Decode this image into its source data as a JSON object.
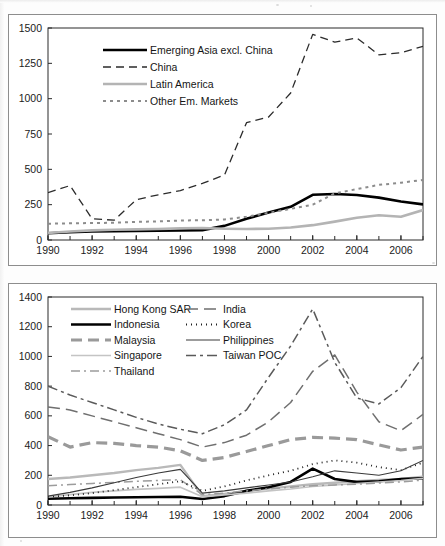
{
  "page": {
    "background_color": "#fdfdfd",
    "frame_color": "#8d8d8d"
  },
  "charts": {
    "top": {
      "panel_name": "top-chart-panel",
      "legend_position": "upper-left-inside"
    },
    "bottom": {
      "panel_name": "bottom-chart-panel",
      "legend_position": "upper-left-inside"
    }
  },
  "chart_data": [
    {
      "type": "line",
      "id": "top",
      "title": "",
      "xlabel": "",
      "ylabel": "",
      "xlim": [
        1990,
        2007
      ],
      "ylim": [
        0,
        1500
      ],
      "yticks": [
        0,
        250,
        500,
        750,
        1000,
        1250,
        1500
      ],
      "ytick_labels": [
        "0",
        "250",
        "500",
        "750",
        "1000",
        "1250",
        "1500"
      ],
      "xticks": [
        1990,
        1992,
        1994,
        1996,
        1998,
        2000,
        2002,
        2004,
        2006
      ],
      "xtick_labels": [
        "1990",
        "1992",
        "1994",
        "1996",
        "1998",
        "2000",
        "2002",
        "2004",
        "2006"
      ],
      "x": [
        1990,
        1991,
        1992,
        1993,
        1994,
        1995,
        1996,
        1997,
        1998,
        1999,
        2000,
        2001,
        2002,
        2003,
        2004,
        2005,
        2006,
        2007
      ],
      "grid": false,
      "legend_position": "upper left",
      "series": [
        {
          "name": "Emerging Asia excl. China",
          "color": "#000000",
          "width": 2.6,
          "dash": "none",
          "values": [
            48,
            55,
            60,
            62,
            64,
            66,
            68,
            70,
            100,
            150,
            195,
            235,
            320,
            325,
            318,
            300,
            272,
            252
          ]
        },
        {
          "name": "China",
          "color": "#2b2b2b",
          "width": 1.3,
          "dash": "8,5",
          "values": [
            335,
            385,
            150,
            140,
            285,
            320,
            350,
            400,
            460,
            830,
            870,
            1040,
            1455,
            1400,
            1430,
            1310,
            1325,
            1370
          ]
        },
        {
          "name": "Latin America",
          "color": "#b4b4b4",
          "width": 2.6,
          "dash": "none",
          "values": [
            50,
            60,
            68,
            72,
            75,
            78,
            82,
            85,
            80,
            78,
            80,
            88,
            105,
            130,
            158,
            175,
            165,
            212
          ]
        },
        {
          "name": "Other Em. Markets",
          "color": "#8c8c8c",
          "width": 2.0,
          "dash": "3,4",
          "values": [
            115,
            118,
            120,
            122,
            128,
            132,
            138,
            140,
            145,
            165,
            192,
            220,
            250,
            330,
            360,
            390,
            405,
            425
          ]
        }
      ]
    },
    {
      "type": "line",
      "id": "bottom",
      "title": "",
      "xlabel": "",
      "ylabel": "",
      "xlim": [
        1990,
        2007
      ],
      "ylim": [
        0,
        1400
      ],
      "yticks": [
        0,
        200,
        400,
        600,
        800,
        1000,
        1200,
        1400
      ],
      "ytick_labels": [
        "0",
        "200",
        "400",
        "600",
        "800",
        "1000",
        "1200",
        "1400"
      ],
      "xticks": [
        1990,
        1992,
        1994,
        1996,
        1998,
        2000,
        2002,
        2004,
        2006
      ],
      "xtick_labels": [
        "1990",
        "1992",
        "1994",
        "1996",
        "1998",
        "2000",
        "2002",
        "2004",
        "2006"
      ],
      "x": [
        1990,
        1991,
        1992,
        1993,
        1994,
        1995,
        1996,
        1997,
        1998,
        1999,
        2000,
        2001,
        2002,
        2003,
        2004,
        2005,
        2006,
        2007
      ],
      "grid": false,
      "legend_position": "upper left",
      "series": [
        {
          "name": "Hong Kong SAR",
          "color": "#b9b9b9",
          "width": 2.4,
          "dash": "none",
          "values": [
            175,
            185,
            200,
            215,
            235,
            250,
            270,
            60,
            75,
            95,
            110,
            125,
            140,
            150,
            160,
            168,
            175,
            190
          ]
        },
        {
          "name": "Indonesia",
          "color": "#000000",
          "width": 2.6,
          "dash": "none",
          "values": [
            42,
            45,
            48,
            50,
            52,
            54,
            56,
            40,
            60,
            95,
            120,
            155,
            245,
            175,
            155,
            160,
            175,
            180
          ]
        },
        {
          "name": "Malaysia",
          "color": "#9a9a9a",
          "width": 3.2,
          "dash": "11,6",
          "values": [
            460,
            390,
            420,
            415,
            400,
            390,
            365,
            300,
            320,
            360,
            400,
            440,
            455,
            450,
            440,
            405,
            370,
            390
          ]
        },
        {
          "name": "Singapore",
          "color": "#c4c4c4",
          "width": 1.6,
          "dash": "none",
          "values": [
            55,
            70,
            85,
            95,
            105,
            112,
            120,
            55,
            68,
            80,
            95,
            108,
            125,
            135,
            145,
            155,
            165,
            180
          ]
        },
        {
          "name": "Thailand",
          "color": "#9c9c9c",
          "width": 1.5,
          "dash": "9,4,2,4",
          "values": [
            130,
            138,
            145,
            152,
            160,
            165,
            170,
            70,
            80,
            95,
            108,
            120,
            130,
            135,
            140,
            148,
            155,
            168
          ]
        },
        {
          "name": "India",
          "color": "#6f6f6f",
          "width": 1.5,
          "dash": "12,6",
          "values": [
            660,
            640,
            600,
            560,
            520,
            480,
            440,
            390,
            420,
            470,
            560,
            690,
            900,
            1010,
            760,
            560,
            500,
            610
          ]
        },
        {
          "name": "Korea",
          "color": "#1f1f1f",
          "width": 1.8,
          "dash": "1,4"
        },
        {
          "name": "Philippines",
          "color": "#3a3a3a",
          "width": 1.1,
          "dash": "none",
          "values": [
            60,
            85,
            115,
            150,
            185,
            215,
            240,
            80,
            95,
            115,
            135,
            155,
            190,
            230,
            215,
            200,
            230,
            300
          ]
        },
        {
          "name": "Taiwan POC",
          "color": "#5a5a5a",
          "width": 1.5,
          "dash": "10,4,3,4",
          "values": [
            800,
            740,
            690,
            640,
            590,
            545,
            510,
            480,
            540,
            640,
            860,
            1070,
            1320,
            960,
            720,
            680,
            790,
            1000
          ]
        }
      ],
      "korea_values": [
        55,
        65,
        80,
        100,
        120,
        140,
        160,
        95,
        125,
        165,
        200,
        230,
        275,
        300,
        285,
        255,
        235,
        285
      ]
    }
  ],
  "top_legend": {
    "items": [
      {
        "label": "Emerging Asia excl. China",
        "style": "thick-solid-black"
      },
      {
        "label": "China",
        "style": "dashed-dark"
      },
      {
        "label": "Latin America",
        "style": "thick-solid-gray"
      },
      {
        "label": "Other Em. Markets",
        "style": "dotted-gray"
      }
    ]
  },
  "bottom_legend": {
    "column_left": [
      {
        "label": "Hong Kong SAR",
        "style": "solid-light-gray"
      },
      {
        "label": "Indonesia",
        "style": "thick-solid-black"
      },
      {
        "label": "Malaysia",
        "style": "thick-dashed-gray"
      },
      {
        "label": "Singapore",
        "style": "thin-solid-light-gray"
      },
      {
        "label": "Thailand",
        "style": "dash-dot-gray"
      }
    ],
    "column_right": [
      {
        "label": "India",
        "style": "long-dashed-gray"
      },
      {
        "label": "Korea",
        "style": "dotted-black"
      },
      {
        "label": "Philippines",
        "style": "thin-solid-dark"
      },
      {
        "label": "Taiwan POC",
        "style": "dash-dot-dark"
      }
    ]
  }
}
